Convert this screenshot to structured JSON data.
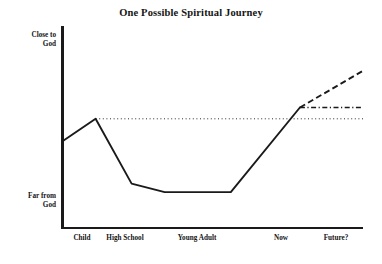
{
  "chart_data": {
    "type": "line",
    "title": "One Possible Spiritual Journey",
    "xlabel": "",
    "ylabel": "",
    "grid": false,
    "legend": false,
    "y_axis": {
      "top_label": "Close to\nGod",
      "top_label_line1": "Close to",
      "top_label_line2": "God",
      "bottom_label": "Far from\nGod",
      "bottom_label_line1": "Far from",
      "bottom_label_line2": "God",
      "range_description": "Far from God (low) to Close to God (high)"
    },
    "categories": [
      "Child",
      "High School",
      "Young Adult",
      "Now",
      "Future?"
    ],
    "series": [
      {
        "name": "Past journey (actual)",
        "style": "solid",
        "color": "#1a1a1a",
        "points": [
          {
            "x": 0,
            "y": 48,
            "note": "start at y-axis, moderate closeness"
          },
          {
            "x": 11,
            "y": 64,
            "label": "Child",
            "note": "local peak of closeness"
          },
          {
            "x": 23,
            "y": 18,
            "note": "sharp decline"
          },
          {
            "x": 34,
            "y": 12,
            "label": "High School",
            "note": "low plateau begins"
          },
          {
            "x": 56,
            "y": 12,
            "label": "Young Adult",
            "note": "low plateau ends"
          },
          {
            "x": 79,
            "y": 72,
            "label": "Now",
            "note": "steady climb to present"
          }
        ]
      },
      {
        "name": "Future projection (continued growth)",
        "style": "dashed",
        "color": "#1a1a1a",
        "points": [
          {
            "x": 79,
            "y": 72,
            "label": "Now"
          },
          {
            "x": 100,
            "y": 98,
            "label": "Future?"
          }
        ]
      },
      {
        "name": "Future projection (plateau)",
        "style": "dash-dot",
        "color": "#1a1a1a",
        "points": [
          {
            "x": 79,
            "y": 72,
            "label": "Now"
          },
          {
            "x": 100,
            "y": 72,
            "label": "Future?"
          }
        ]
      },
      {
        "name": "Reference level (childhood peak)",
        "style": "dotted",
        "color": "#2b2b2b",
        "points": [
          {
            "x": 11,
            "y": 64
          },
          {
            "x": 100,
            "y": 64
          }
        ]
      }
    ],
    "annotations": [
      "Solid line shows the journey from childhood to the present",
      "Dashed and dash-dot lines show two possible futures beyond Now",
      "Dotted horizontal line marks the childhood peak level for comparison"
    ]
  },
  "xtick_positions": [
    82,
    125,
    197,
    281,
    336
  ]
}
